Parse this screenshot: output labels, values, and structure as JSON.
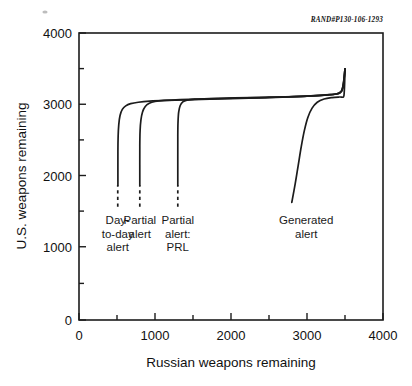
{
  "document_id": "RAND#P130-106-1293",
  "chart_data": {
    "type": "line",
    "title": "",
    "xlabel": "Russian weapons remaining",
    "ylabel": "U.S. weapons remaining",
    "xlim": [
      0,
      4000
    ],
    "ylim": [
      0,
      4000
    ],
    "xticks": [
      0,
      1000,
      2000,
      3000,
      4000
    ],
    "yticks": [
      0,
      1000,
      2000,
      3000,
      4000
    ],
    "xtick_labels": [
      "0",
      "1000",
      "2000",
      "3000",
      "4000"
    ],
    "ytick_labels": [
      "0",
      "1000",
      "2000",
      "3000",
      "4000"
    ],
    "minor_tick_interval": 500,
    "grid": false,
    "legend": "inline annotations",
    "series": [
      {
        "name": "Day-to-day alert",
        "label_lines": [
          "Day-",
          "to-day",
          "alert"
        ],
        "label_x": 510,
        "dashed_stub": {
          "x": 510,
          "y_from": 1580,
          "y_to": 1880
        },
        "points": [
          [
            512,
            1880
          ],
          [
            512,
            2350
          ],
          [
            515,
            2560
          ],
          [
            523,
            2720
          ],
          [
            540,
            2850
          ],
          [
            570,
            2935
          ],
          [
            615,
            2985
          ],
          [
            680,
            3015
          ],
          [
            780,
            3035
          ],
          [
            930,
            3050
          ],
          [
            1150,
            3060
          ],
          [
            1500,
            3070
          ],
          [
            2000,
            3085
          ],
          [
            2500,
            3100
          ],
          [
            3000,
            3120
          ],
          [
            3300,
            3140
          ],
          [
            3420,
            3165
          ],
          [
            3470,
            3240
          ],
          [
            3500,
            3500
          ]
        ]
      },
      {
        "name": "Partial alert",
        "label_lines": [
          "Partial",
          "alert"
        ],
        "label_x": 800,
        "dashed_stub": {
          "x": 800,
          "y_from": 1580,
          "y_to": 1880
        },
        "points": [
          [
            800,
            1880
          ],
          [
            800,
            2420
          ],
          [
            804,
            2640
          ],
          [
            815,
            2790
          ],
          [
            836,
            2900
          ],
          [
            872,
            2975
          ],
          [
            925,
            3020
          ],
          [
            1000,
            3045
          ],
          [
            1120,
            3060
          ],
          [
            1330,
            3072
          ],
          [
            1700,
            3082
          ],
          [
            2200,
            3095
          ],
          [
            2700,
            3108
          ],
          [
            3150,
            3128
          ],
          [
            3380,
            3150
          ],
          [
            3450,
            3185
          ],
          [
            3480,
            3300
          ],
          [
            3500,
            3500
          ]
        ]
      },
      {
        "name": "Partial alert: PRL",
        "label_lines": [
          "Partial",
          "alert:",
          "PRL"
        ],
        "label_x": 1300,
        "dashed_stub": {
          "x": 1300,
          "y_from": 1580,
          "y_to": 1880
        },
        "points": [
          [
            1300,
            1880
          ],
          [
            1300,
            2560
          ],
          [
            1303,
            2760
          ],
          [
            1312,
            2900
          ],
          [
            1332,
            2990
          ],
          [
            1366,
            3040
          ],
          [
            1420,
            3065
          ],
          [
            1520,
            3078
          ],
          [
            1720,
            3085
          ],
          [
            2050,
            3095
          ],
          [
            2500,
            3105
          ],
          [
            3000,
            3120
          ],
          [
            3300,
            3140
          ],
          [
            3430,
            3165
          ],
          [
            3475,
            3245
          ],
          [
            3500,
            3500
          ]
        ]
      },
      {
        "name": "Generated alert",
        "label_lines": [
          "Generated",
          "alert"
        ],
        "label_x": 2990,
        "dashed_stub": null,
        "points": [
          [
            2800,
            1640
          ],
          [
            2845,
            1900
          ],
          [
            2885,
            2160
          ],
          [
            2925,
            2420
          ],
          [
            2965,
            2640
          ],
          [
            3010,
            2820
          ],
          [
            3065,
            2950
          ],
          [
            3135,
            3035
          ],
          [
            3225,
            3080
          ],
          [
            3330,
            3100
          ],
          [
            3430,
            3108
          ],
          [
            3480,
            3110
          ],
          [
            3490,
            3180
          ],
          [
            3496,
            3330
          ],
          [
            3500,
            3500
          ]
        ]
      }
    ]
  }
}
